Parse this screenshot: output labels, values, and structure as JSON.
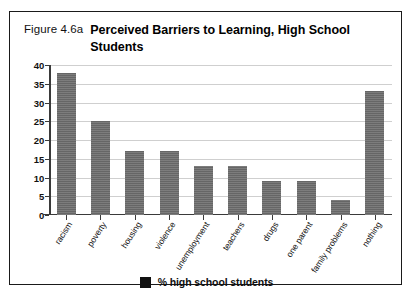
{
  "figure": {
    "number": "Figure 4.6a",
    "title": "Perceived Barriers to Learning, High School Students"
  },
  "legend": {
    "label": "% high school students",
    "swatch_color": "#111111"
  },
  "style": {
    "bar_color": "#6e6e6e",
    "grid_color": "#cfcfcf",
    "axis_color": "#3a3a3a",
    "frame_color": "#1a1a1a",
    "background": "#ffffff"
  },
  "chart_data": {
    "type": "bar",
    "title": "Perceived Barriers to Learning, High School Students",
    "xlabel": "",
    "ylabel": "",
    "ylim": [
      0,
      40
    ],
    "yticks": [
      0,
      5,
      10,
      15,
      20,
      25,
      30,
      35,
      40
    ],
    "grid": true,
    "legend_position": "bottom-center",
    "categories": [
      "racism",
      "poverty",
      "housing",
      "violence",
      "unemployment",
      "teachers",
      "drugs",
      "one parent",
      "family problems",
      "nothing"
    ],
    "series": [
      {
        "name": "% high school students",
        "values": [
          38,
          25,
          17,
          17,
          13,
          13,
          9,
          9,
          4,
          33
        ]
      }
    ]
  }
}
